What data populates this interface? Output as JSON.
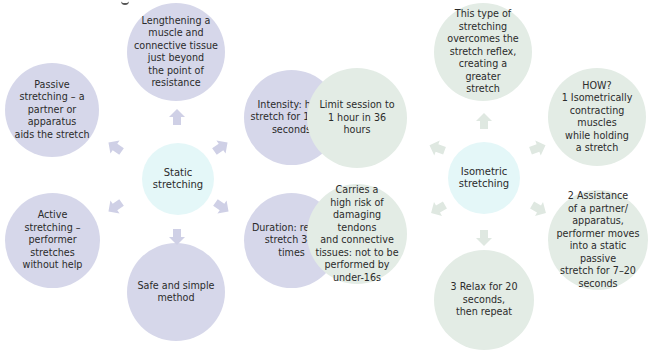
{
  "colors": {
    "static_outer": "#d6d7ea",
    "isometric_outer": "#e3ece5",
    "hub": "#e4f7f8",
    "static_arrow": "#cfd0e6",
    "isometric_arrow": "#dfe8e1",
    "text": "#2b2b2b"
  },
  "static": {
    "center": "Static stretching",
    "nodes": {
      "top": "Lengthening a\nmuscle and\nconnective tissue\njust beyond\nthe point of\nresistance",
      "top_left": "Passive\nstretching – a\npartner or\napparatus\naids the stretch",
      "top_right": "Intensity: hold\nstretch for 10–30\nseconds",
      "bottom_left": "Active\nstretching –\nperformer stretches\nwithout help",
      "bottom_right": "Duration: repeat\nstretch 3–6 times",
      "bottom": "Safe and simple\nmethod"
    }
  },
  "isometric": {
    "center": "Isometric\nstretching",
    "nodes": {
      "top": "This type of\nstretching\novercomes the\nstretch reflex,\ncreating a greater\nstretch",
      "top_left": "Limit session to\n1 hour in 36 hours",
      "top_right": "HOW?\n1 Isometrically\ncontracting muscles\nwhile holding\na stretch",
      "bottom_left": "Carries a\nhigh risk of\ndamaging tendons\nand connective\ntissues: not to be\nperformed by\nunder-16s",
      "bottom_right": "2 Assistance\nof a partner/\napparatus,\nperformer moves\ninto a static passive\nstretch for 7–20\nseconds",
      "bottom": "3 Relax for 20\nseconds,\nthen repeat"
    }
  }
}
